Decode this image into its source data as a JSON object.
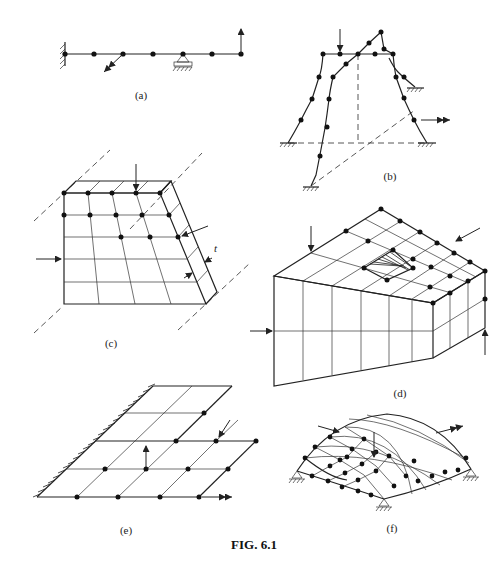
{
  "figure": {
    "caption": "FIG. 6.1",
    "panels": [
      {
        "id": "a",
        "label": "(a)",
        "description": "Beam with fixed support, roller support, nodes and point loads"
      },
      {
        "id": "b",
        "label": "(b)",
        "description": "Space frame with fixed bases and applied loads"
      },
      {
        "id": "c",
        "label": "(c)",
        "description": "Plate strip of thickness t with nodal grid"
      },
      {
        "id": "d",
        "label": "(d)",
        "description": "3D solid block with hole, meshed into elements"
      },
      {
        "id": "e",
        "label": "(e)",
        "description": "Cantilever plate grid clamped along one edge"
      },
      {
        "id": "f",
        "label": "(f)",
        "description": "Curved shell supported at corners"
      }
    ],
    "annotations": {
      "thickness_symbol": "t"
    }
  }
}
